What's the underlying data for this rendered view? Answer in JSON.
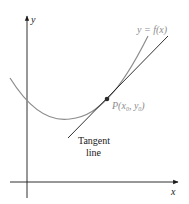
{
  "diagram": {
    "axes": {
      "x_label": "x",
      "y_label": "y",
      "color": "#1a1a1a"
    },
    "curve": {
      "label": "y = f(x)",
      "color": "#8c8c8c"
    },
    "tangent": {
      "label_line1": "Tangent",
      "label_line2": "line",
      "color": "#1a1a1a"
    },
    "point": {
      "label_prefix": "P(x",
      "sub0": "0",
      "mid": ", y",
      "sub1": "0",
      "suffix": ")",
      "color": "#2a2a2a",
      "label_color": "#8c8c8c"
    }
  }
}
